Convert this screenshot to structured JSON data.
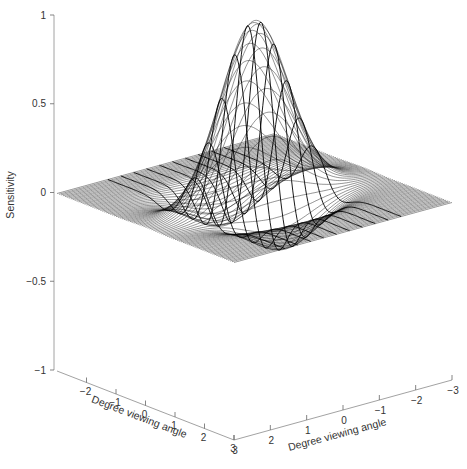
{
  "chart_data": {
    "type": "surface",
    "title": "",
    "zlabel": "Sensitivity",
    "xlabel": "Degree viewing angle",
    "ylabel": "Degree viewing angle",
    "zlim": [
      -1,
      1
    ],
    "xlim": [
      -3,
      3
    ],
    "ylim": [
      -3,
      3
    ],
    "z_ticks": [
      {
        "value": 1,
        "label": "1"
      },
      {
        "value": 0.5,
        "label": "0.5"
      },
      {
        "value": 0,
        "label": "0"
      },
      {
        "value": -0.5,
        "label": "−0.5"
      },
      {
        "value": -1,
        "label": "−1"
      }
    ],
    "x_ticks": [
      {
        "value": -2,
        "label": "−2"
      },
      {
        "value": -1,
        "label": "−1"
      },
      {
        "value": 0,
        "label": "0"
      },
      {
        "value": 1,
        "label": "1"
      },
      {
        "value": 2,
        "label": "2"
      },
      {
        "value": 3,
        "label": "3"
      }
    ],
    "y_ticks": [
      {
        "value": 3,
        "label": "3"
      },
      {
        "value": 2,
        "label": "2"
      },
      {
        "value": 1,
        "label": "1"
      },
      {
        "value": 0,
        "label": "0"
      },
      {
        "value": -1,
        "label": "−1"
      },
      {
        "value": -2,
        "label": "−2"
      },
      {
        "value": -3,
        "label": "−3"
      }
    ],
    "surface": {
      "description": "Gabor-like receptive field sensitivity profile: central positive lobe flanked by two negative lobes",
      "peak_value": 1.0,
      "negative_lobe_value": -0.7,
      "grid_range": [
        -3,
        3
      ]
    },
    "grid": false,
    "legend": "none"
  }
}
